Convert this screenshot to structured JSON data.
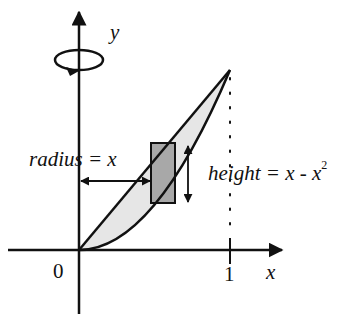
{
  "diagram": {
    "type": "solid-of-revolution",
    "axes": {
      "x_label": "x",
      "y_label": "y",
      "origin_label": "0",
      "x_tick_label": "1"
    },
    "curves": [
      {
        "name": "upper",
        "equation": "y = x"
      },
      {
        "name": "lower",
        "equation": "y = x^2"
      }
    ],
    "annotations": {
      "radius": "radius = x",
      "height_text": "height = x - x",
      "height_exponent": "2"
    },
    "colors": {
      "stroke": "#111111",
      "region_fill": "#e6e6e6",
      "shell_fill": "#a8a8a8"
    }
  }
}
